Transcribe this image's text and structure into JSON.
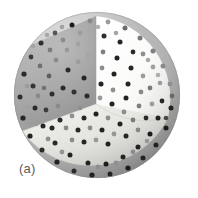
{
  "figure": {
    "panel_label": "(a)",
    "caption_alt": "Sphere with one octant removed showing interior particle distribution",
    "background_color": "#ffffff"
  },
  "chart_data": {
    "type": "scatter",
    "title": "",
    "subtitle": "",
    "xlabel": "",
    "ylabel": "",
    "annotations": [
      "(a)"
    ],
    "legend": [],
    "grid": false,
    "geometry": {
      "shape": "sphere",
      "cutaway": "octant",
      "center_x": 97,
      "center_y": 95,
      "radius": 83,
      "cut_origin_x": 96,
      "cut_origin_y": 104
    },
    "surfaces": [
      {
        "name": "outer-shell-upper-left",
        "color": "#b9b9b9"
      },
      {
        "name": "outer-shell-lower-right",
        "color": "#a2a2a2"
      },
      {
        "name": "cut-plane-left",
        "color": "#9d9d9d"
      },
      {
        "name": "cut-plane-right",
        "color": "#fbfbfb"
      },
      {
        "name": "cut-plane-bottom",
        "color": "#e2e2de"
      }
    ],
    "particles": {
      "marker": "circle",
      "color_dark": "#1c1c1c",
      "color_mid": "#7d7d7d",
      "color_light": "#b4b4b4",
      "radius_px": 2.6,
      "count": 118,
      "points": [
        {
          "x": 24,
          "y": 74,
          "r": 2.6,
          "c": "#2a2a2a"
        },
        {
          "x": 20,
          "y": 97,
          "r": 2.5,
          "c": "#2f2f2f"
        },
        {
          "x": 23,
          "y": 118,
          "r": 2.6,
          "c": "#262626"
        },
        {
          "x": 31,
          "y": 57,
          "r": 2.4,
          "c": "#3a3a3a"
        },
        {
          "x": 30,
          "y": 136,
          "r": 2.6,
          "c": "#242424"
        },
        {
          "x": 41,
          "y": 43,
          "r": 2.5,
          "c": "#2d2d2d"
        },
        {
          "x": 42,
          "y": 150,
          "r": 2.5,
          "c": "#2a2a2a"
        },
        {
          "x": 55,
          "y": 33,
          "r": 2.4,
          "c": "#555555"
        },
        {
          "x": 57,
          "y": 162,
          "r": 2.6,
          "c": "#222222"
        },
        {
          "x": 72,
          "y": 25,
          "r": 2.5,
          "c": "#1f1f1f"
        },
        {
          "x": 74,
          "y": 171,
          "r": 2.5,
          "c": "#2b2b2b"
        },
        {
          "x": 90,
          "y": 21,
          "r": 2.4,
          "c": "#8a8a8a"
        },
        {
          "x": 92,
          "y": 175,
          "r": 2.6,
          "c": "#202020"
        },
        {
          "x": 108,
          "y": 22,
          "r": 2.4,
          "c": "#9a9a9a"
        },
        {
          "x": 110,
          "y": 174,
          "r": 2.5,
          "c": "#242424"
        },
        {
          "x": 125,
          "y": 28,
          "r": 2.5,
          "c": "#6e6e6e"
        },
        {
          "x": 128,
          "y": 168,
          "r": 2.6,
          "c": "#1f1f1f"
        },
        {
          "x": 140,
          "y": 38,
          "r": 2.5,
          "c": "#7a7a7a"
        },
        {
          "x": 143,
          "y": 158,
          "r": 2.5,
          "c": "#232323"
        },
        {
          "x": 153,
          "y": 51,
          "r": 2.5,
          "c": "#7f7f7f"
        },
        {
          "x": 156,
          "y": 145,
          "r": 2.5,
          "c": "#212121"
        },
        {
          "x": 163,
          "y": 66,
          "r": 2.5,
          "c": "#8b8b8b"
        },
        {
          "x": 166,
          "y": 128,
          "r": 2.5,
          "c": "#1e1e1e"
        },
        {
          "x": 170,
          "y": 84,
          "r": 2.4,
          "c": "#8f8f8f"
        },
        {
          "x": 171,
          "y": 108,
          "r": 2.5,
          "c": "#202020"
        },
        {
          "x": 172,
          "y": 96,
          "r": 2.4,
          "c": "#6a6a6a"
        },
        {
          "x": 33,
          "y": 86,
          "r": 2.5,
          "c": "#353535"
        },
        {
          "x": 35,
          "y": 108,
          "r": 2.5,
          "c": "#2c2c2c"
        },
        {
          "x": 40,
          "y": 66,
          "r": 2.4,
          "c": "#6f6f6f"
        },
        {
          "x": 43,
          "y": 126,
          "r": 2.5,
          "c": "#272727"
        },
        {
          "x": 50,
          "y": 50,
          "r": 2.4,
          "c": "#7b7b7b"
        },
        {
          "x": 55,
          "y": 143,
          "r": 2.5,
          "c": "#2a2a2a"
        },
        {
          "x": 63,
          "y": 40,
          "r": 2.4,
          "c": "#8c8c8c"
        },
        {
          "x": 70,
          "y": 155,
          "r": 2.5,
          "c": "#232323"
        },
        {
          "x": 80,
          "y": 33,
          "r": 2.4,
          "c": "#9c9c9c"
        },
        {
          "x": 88,
          "y": 163,
          "r": 2.5,
          "c": "#212121"
        },
        {
          "x": 106,
          "y": 164,
          "r": 2.5,
          "c": "#1f1f1f"
        },
        {
          "x": 123,
          "y": 157,
          "r": 2.5,
          "c": "#242424"
        },
        {
          "x": 138,
          "y": 147,
          "r": 2.5,
          "c": "#222222"
        },
        {
          "x": 150,
          "y": 134,
          "r": 2.5,
          "c": "#1e1e1e"
        },
        {
          "x": 158,
          "y": 118,
          "r": 2.5,
          "c": "#232323"
        },
        {
          "x": 162,
          "y": 101,
          "r": 2.4,
          "c": "#262626"
        },
        {
          "x": 160,
          "y": 83,
          "r": 2.3,
          "c": "#9b9b9b"
        },
        {
          "x": 153,
          "y": 67,
          "r": 2.4,
          "c": "#9f9f9f"
        },
        {
          "x": 143,
          "y": 54,
          "r": 2.4,
          "c": "#8e8e8e"
        },
        {
          "x": 52,
          "y": 94,
          "r": 2.5,
          "c": "#2e2e2e"
        },
        {
          "x": 49,
          "y": 76,
          "r": 2.4,
          "c": "#5f5f5f"
        },
        {
          "x": 56,
          "y": 60,
          "r": 2.4,
          "c": "#8a8a8a"
        },
        {
          "x": 67,
          "y": 50,
          "r": 2.4,
          "c": "#9b9b9b"
        },
        {
          "x": 78,
          "y": 44,
          "r": 2.4,
          "c": "#a2a2a2"
        },
        {
          "x": 68,
          "y": 70,
          "r": 2.5,
          "c": "#2b2b2b"
        },
        {
          "x": 63,
          "y": 88,
          "r": 2.5,
          "c": "#2b2b2b"
        },
        {
          "x": 78,
          "y": 62,
          "r": 2.4,
          "c": "#9d9d9d"
        },
        {
          "x": 84,
          "y": 78,
          "r": 2.5,
          "c": "#262626"
        },
        {
          "x": 74,
          "y": 92,
          "r": 2.5,
          "c": "#303030"
        },
        {
          "x": 88,
          "y": 55,
          "r": 2.4,
          "c": "#a5a5a5"
        },
        {
          "x": 87,
          "y": 96,
          "r": 2.5,
          "c": "#2a2a2a"
        },
        {
          "x": 58,
          "y": 106,
          "r": 2.4,
          "c": "#8a8a8a"
        },
        {
          "x": 46,
          "y": 110,
          "r": 2.4,
          "c": "#3a3a3a"
        },
        {
          "x": 80,
          "y": 108,
          "r": 2.3,
          "c": "#8f8f8f"
        },
        {
          "x": 104,
          "y": 36,
          "r": 2.5,
          "c": "#2e2e2e"
        },
        {
          "x": 120,
          "y": 42,
          "r": 2.5,
          "c": "#262626"
        },
        {
          "x": 133,
          "y": 52,
          "r": 2.4,
          "c": "#2c2c2c"
        },
        {
          "x": 103,
          "y": 52,
          "r": 2.4,
          "c": "#7f7f7f"
        },
        {
          "x": 117,
          "y": 58,
          "r": 2.5,
          "c": "#242424"
        },
        {
          "x": 131,
          "y": 68,
          "r": 2.5,
          "c": "#282828"
        },
        {
          "x": 143,
          "y": 76,
          "r": 2.4,
          "c": "#9b9b9b"
        },
        {
          "x": 102,
          "y": 68,
          "r": 2.4,
          "c": "#8c8c8c"
        },
        {
          "x": 114,
          "y": 74,
          "r": 2.5,
          "c": "#212121"
        },
        {
          "x": 128,
          "y": 84,
          "r": 2.5,
          "c": "#252525"
        },
        {
          "x": 141,
          "y": 92,
          "r": 2.4,
          "c": "#8a8a8a"
        },
        {
          "x": 101,
          "y": 84,
          "r": 2.5,
          "c": "#202020"
        },
        {
          "x": 113,
          "y": 90,
          "r": 2.4,
          "c": "#8f8f8f"
        },
        {
          "x": 126,
          "y": 98,
          "r": 2.5,
          "c": "#242424"
        },
        {
          "x": 139,
          "y": 106,
          "r": 2.4,
          "c": "#7d7d7d"
        },
        {
          "x": 100,
          "y": 98,
          "r": 2.4,
          "c": "#9a9a9a"
        },
        {
          "x": 112,
          "y": 104,
          "r": 2.5,
          "c": "#222222"
        },
        {
          "x": 124,
          "y": 112,
          "r": 2.4,
          "c": "#8d8d8d"
        },
        {
          "x": 150,
          "y": 88,
          "r": 2.4,
          "c": "#7a7a7a"
        },
        {
          "x": 152,
          "y": 104,
          "r": 2.4,
          "c": "#9d9d9d"
        },
        {
          "x": 96,
          "y": 114,
          "r": 2.5,
          "c": "#202020"
        },
        {
          "x": 108,
          "y": 118,
          "r": 2.4,
          "c": "#8e8e8e"
        },
        {
          "x": 120,
          "y": 124,
          "r": 2.5,
          "c": "#242424"
        },
        {
          "x": 133,
          "y": 120,
          "r": 2.4,
          "c": "#7c7c7c"
        },
        {
          "x": 84,
          "y": 118,
          "r": 2.5,
          "c": "#272727"
        },
        {
          "x": 72,
          "y": 116,
          "r": 2.4,
          "c": "#909090"
        },
        {
          "x": 60,
          "y": 120,
          "r": 2.5,
          "c": "#2a2a2a"
        },
        {
          "x": 90,
          "y": 128,
          "r": 2.4,
          "c": "#8b8b8b"
        },
        {
          "x": 102,
          "y": 130,
          "r": 2.5,
          "c": "#212121"
        },
        {
          "x": 114,
          "y": 134,
          "r": 2.4,
          "c": "#969696"
        },
        {
          "x": 126,
          "y": 136,
          "r": 2.5,
          "c": "#262626"
        },
        {
          "x": 78,
          "y": 130,
          "r": 2.5,
          "c": "#252525"
        },
        {
          "x": 66,
          "y": 128,
          "r": 2.4,
          "c": "#8a8a8a"
        },
        {
          "x": 96,
          "y": 140,
          "r": 2.4,
          "c": "#999999"
        },
        {
          "x": 108,
          "y": 144,
          "r": 2.5,
          "c": "#232323"
        },
        {
          "x": 84,
          "y": 142,
          "r": 2.5,
          "c": "#282828"
        },
        {
          "x": 72,
          "y": 140,
          "r": 2.4,
          "c": "#8d8d8d"
        },
        {
          "x": 138,
          "y": 130,
          "r": 2.4,
          "c": "#888888"
        },
        {
          "x": 146,
          "y": 118,
          "r": 2.4,
          "c": "#2c2c2c"
        },
        {
          "x": 52,
          "y": 128,
          "r": 2.5,
          "c": "#262626"
        },
        {
          "x": 38,
          "y": 96,
          "r": 2.4,
          "c": "#8a8a8a"
        },
        {
          "x": 27,
          "y": 86,
          "r": 2.3,
          "c": "#9c9c9c"
        },
        {
          "x": 28,
          "y": 107,
          "r": 2.3,
          "c": "#a0a0a0"
        },
        {
          "x": 36,
          "y": 124,
          "r": 2.3,
          "c": "#9b9b9b"
        },
        {
          "x": 48,
          "y": 139,
          "r": 2.4,
          "c": "#8f8f8f"
        },
        {
          "x": 62,
          "y": 152,
          "r": 2.4,
          "c": "#959595"
        },
        {
          "x": 98,
          "y": 167,
          "r": 2.4,
          "c": "#8e8e8e"
        },
        {
          "x": 116,
          "y": 163,
          "r": 2.4,
          "c": "#909090"
        },
        {
          "x": 133,
          "y": 152,
          "r": 2.4,
          "c": "#8c8c8c"
        },
        {
          "x": 147,
          "y": 141,
          "r": 2.3,
          "c": "#969696"
        },
        {
          "x": 33,
          "y": 46,
          "r": 2.3,
          "c": "#a4a4a4"
        },
        {
          "x": 47,
          "y": 35,
          "r": 2.3,
          "c": "#a8a8a8"
        },
        {
          "x": 62,
          "y": 27,
          "r": 2.3,
          "c": "#a1a1a1"
        },
        {
          "x": 98,
          "y": 27,
          "r": 2.3,
          "c": "#b0b0b0"
        },
        {
          "x": 116,
          "y": 33,
          "r": 2.3,
          "c": "#a6a6a6"
        },
        {
          "x": 148,
          "y": 60,
          "r": 2.3,
          "c": "#a9a9a9"
        },
        {
          "x": 158,
          "y": 75,
          "r": 2.3,
          "c": "#adadad"
        },
        {
          "x": 166,
          "y": 118,
          "r": 2.3,
          "c": "#454545"
        },
        {
          "x": 44,
          "y": 88,
          "r": 2.3,
          "c": "#727272"
        }
      ]
    }
  }
}
